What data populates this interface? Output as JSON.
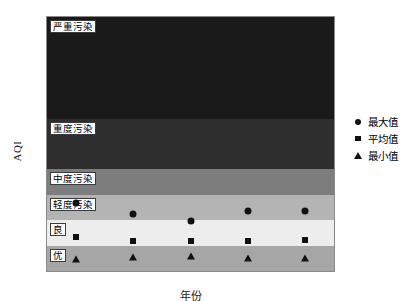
{
  "chart_data": {
    "type": "scatter",
    "title": "",
    "xlabel": "年份",
    "ylabel": "AQI",
    "categories": [
      "2014",
      "2015",
      "2016",
      "2017",
      "2018"
    ],
    "ylim": [
      0,
      500
    ],
    "yticks": [
      0,
      50,
      100,
      150,
      200,
      250,
      300,
      350,
      400,
      450,
      500
    ],
    "grid": false,
    "legend_position": "right",
    "series": [
      {
        "name": "最大值",
        "marker": "circle",
        "values": [
          133,
          113,
          98,
          118,
          118
        ]
      },
      {
        "name": "平均值",
        "marker": "square",
        "values": [
          67,
          60,
          60,
          60,
          62
        ]
      },
      {
        "name": "最小值",
        "marker": "triangle",
        "values": [
          24,
          27,
          30,
          26,
          26
        ]
      }
    ],
    "bands": [
      {
        "label": "优",
        "min": 0,
        "max": 50,
        "color": "#a6a6a6"
      },
      {
        "label": "良",
        "min": 50,
        "max": 100,
        "color": "#ededed"
      },
      {
        "label": "轻度污染",
        "min": 100,
        "max": 150,
        "color": "#b4b4b4"
      },
      {
        "label": "中度污染",
        "min": 150,
        "max": 200,
        "color": "#7d7d7d"
      },
      {
        "label": "重度污染",
        "min": 200,
        "max": 300,
        "color": "#2e2e2e"
      },
      {
        "label": "严重污染",
        "min": 300,
        "max": 500,
        "color": "#1a1a1a"
      }
    ]
  },
  "axes": {
    "y_title": "AQI",
    "x_title": "年份"
  },
  "legend": {
    "items": [
      {
        "label": "最大值"
      },
      {
        "label": "平均值"
      },
      {
        "label": "最小值"
      }
    ]
  },
  "colors": {
    "marker": "#111111",
    "frame": "#8a8a8a",
    "text": "#1a1a1a"
  }
}
